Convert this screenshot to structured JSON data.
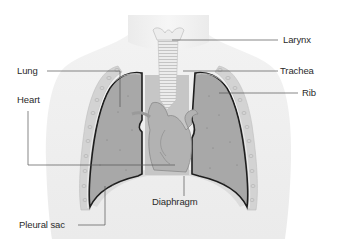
{
  "diagram": {
    "labels": {
      "larynx": "Larynx",
      "trachea": "Trachea",
      "rib": "Rib",
      "lung": "Lung",
      "heart": "Heart",
      "diaphragm": "Diaphragm",
      "pleural_sac": "Pleural sac"
    },
    "colors": {
      "background": "#ffffff",
      "body_silhouette": "#f1f1f1",
      "lung_fill": "#a9a9a9",
      "heart_fill": "#b4b4b4",
      "rib_cage": "#cfcfcf",
      "pleura_outline": "#1e1e1e",
      "trachea_fill": "#e8e8e8",
      "leader_line": "#555555",
      "label_text": "#2a2a2a"
    }
  }
}
